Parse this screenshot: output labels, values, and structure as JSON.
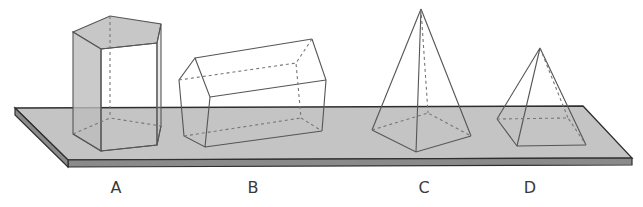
{
  "figure": {
    "colors": {
      "plank_top": "#c4c4c4",
      "plank_edge": "#8a8a8a",
      "outline": "#2e2e2e",
      "edge": "#555555",
      "face_shade": "#bdbdbd",
      "hidden_edge": "#777777"
    },
    "shapes": [
      {
        "label": "A",
        "name": "pentagonal prism (upright)"
      },
      {
        "label": "B",
        "name": "pentagonal prism (lying)"
      },
      {
        "label": "C",
        "name": "pentagonal pyramid"
      },
      {
        "label": "D",
        "name": "square pyramid"
      }
    ]
  }
}
